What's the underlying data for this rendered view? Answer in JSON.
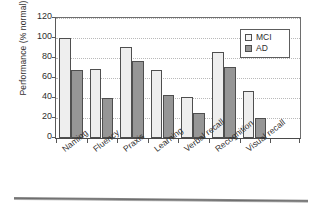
{
  "chart_data": {
    "type": "bar",
    "title": "",
    "xlabel": "",
    "ylabel": "Performance (% normal)",
    "ylim": [
      0,
      120
    ],
    "yticks": [
      0,
      20,
      40,
      60,
      80,
      100,
      120
    ],
    "grid": true,
    "legend_position": "upper-right",
    "categories": [
      "Naming",
      "Fluency",
      "Praxis",
      "Learning",
      "Verbal recall",
      "Recognition",
      "Visual recall"
    ],
    "series": [
      {
        "name": "MCI",
        "color": "#eeeeee",
        "values": [
          100,
          69,
          91,
          68,
          41,
          86,
          47
        ]
      },
      {
        "name": "AD",
        "color": "#969696",
        "values": [
          68,
          40,
          77,
          43,
          25,
          71,
          20
        ]
      }
    ]
  },
  "legend": {
    "items": [
      {
        "label": "MCI"
      },
      {
        "label": "AD"
      }
    ]
  },
  "figure": {
    "rule_label": "bottom-rule"
  }
}
